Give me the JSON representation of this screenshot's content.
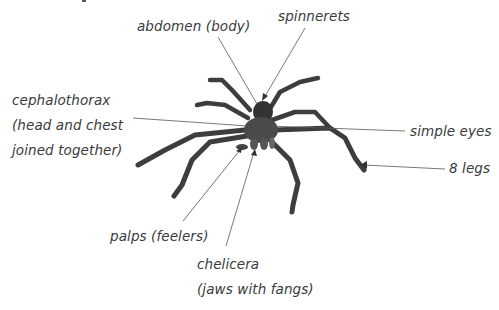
{
  "diagram": {
    "labels": {
      "abdomen": "abdomen (body)",
      "spinnerets": "spinnerets",
      "cephalothorax": [
        "cephalothorax",
        "(head and chest",
        "joined together)"
      ],
      "simple_eyes": "simple eyes",
      "legs": "8 legs",
      "palps": "palps (feelers)",
      "chelicera": [
        "chelicera",
        "(jaws with fangs)"
      ]
    },
    "colors": {
      "background": "#ffffff",
      "text": "#3a3a3a",
      "leader_line": "#555555",
      "spider_body": "#3d3d3d"
    }
  }
}
